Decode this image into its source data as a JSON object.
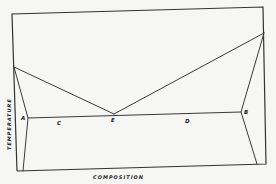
{
  "diagram": {
    "type": "eutectic phase diagram",
    "axes": {
      "xlabel": "COMPOSITION",
      "ylabel": "TEMPERATURE"
    },
    "points": {
      "A": "A",
      "B": "B",
      "C": "C",
      "D": "D",
      "E": "E"
    },
    "colors": {
      "background": "#f6f6f4",
      "line": "#3a3a3a"
    }
  }
}
